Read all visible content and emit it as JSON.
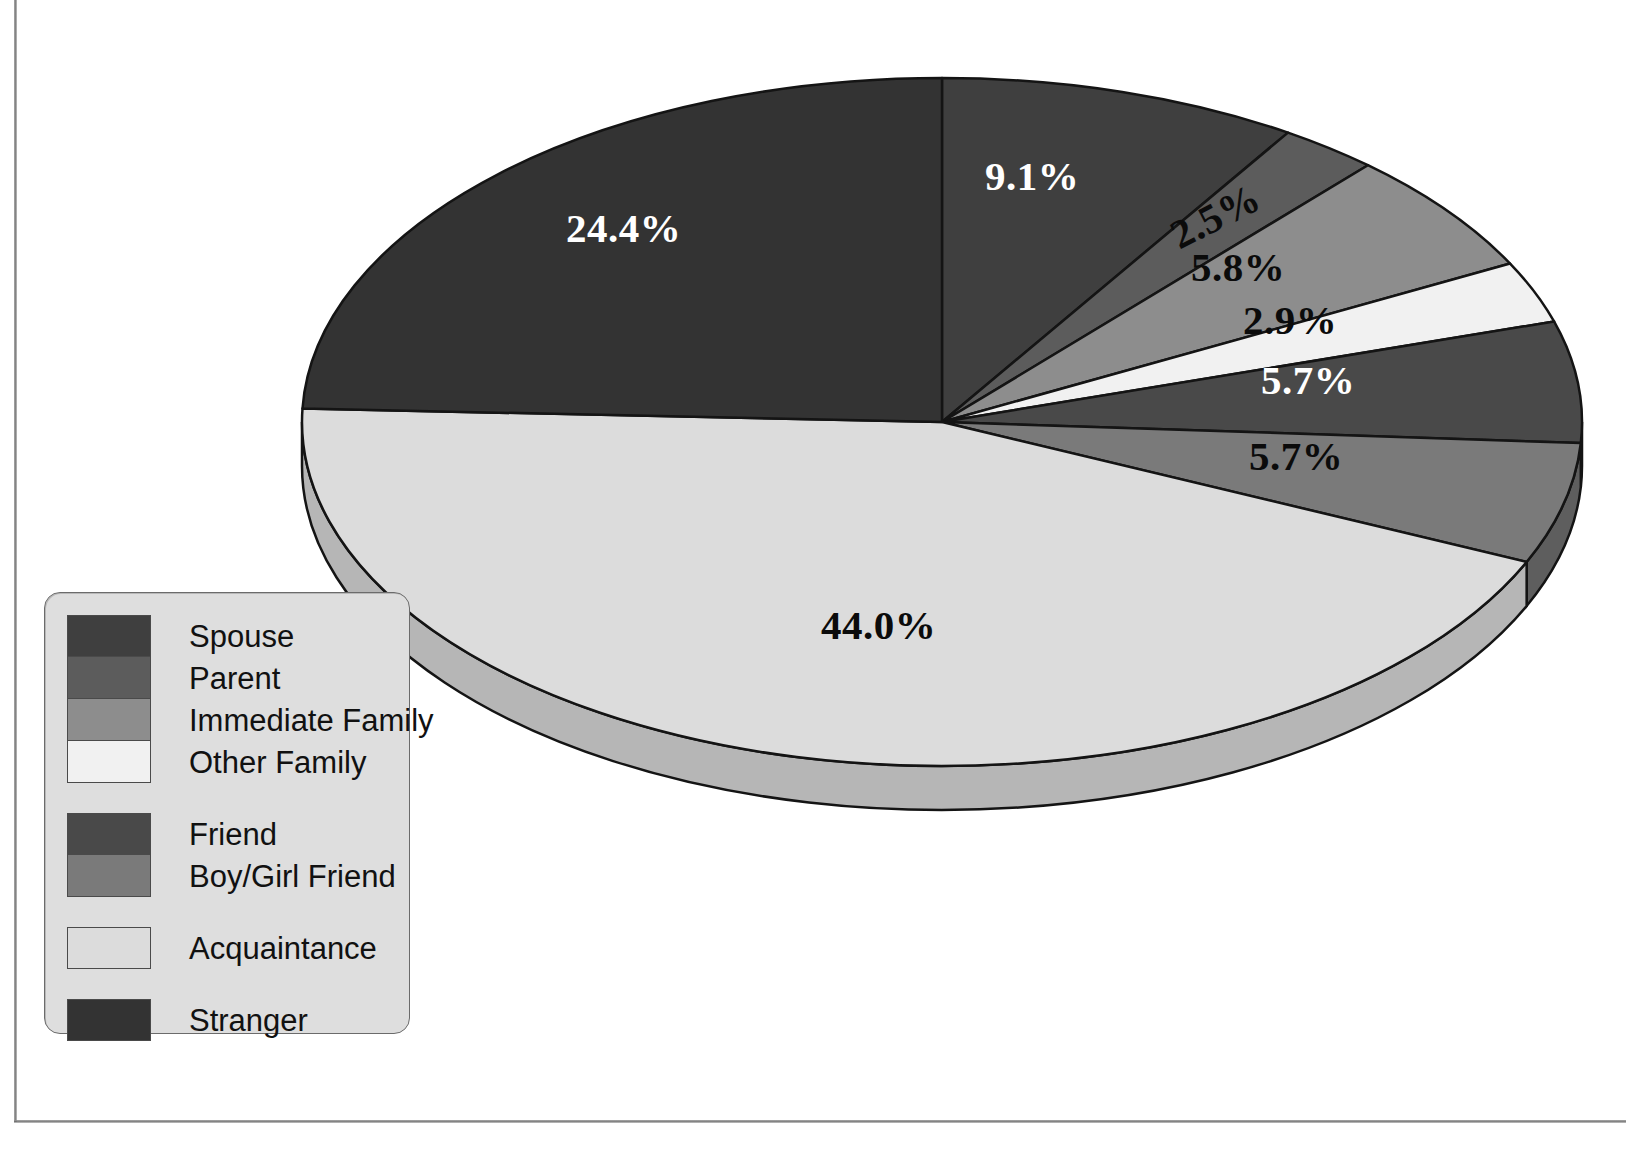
{
  "chart_data": {
    "type": "pie",
    "title": "",
    "subtitle": "",
    "xlabel": "",
    "ylabel": "",
    "grid": false,
    "legend_position": "bottom-left",
    "three_d": true,
    "start_angle_deg": 0,
    "direction": "clockwise",
    "categories": [
      "Spouse",
      "Parent",
      "Immediate Family",
      "Other Family",
      "Friend",
      "Boy/Girl Friend",
      "Acquaintance",
      "Stranger"
    ],
    "values": [
      9.1,
      2.5,
      5.8,
      2.9,
      5.7,
      5.7,
      44.0,
      24.4
    ],
    "labels": [
      "9.1%",
      "2.5%",
      "5.8%",
      "2.9%",
      "5.7%",
      "5.7%",
      "44.0%",
      "24.4%"
    ],
    "units": "percent",
    "colors": [
      "#3f3f3f",
      "#5c5c5c",
      "#8d8d8d",
      "#f1f1f1",
      "#494949",
      "#7a7a7a",
      "#dcdcdc",
      "#333333"
    ],
    "side_colors": [
      "#2e2e2e",
      "#474747",
      "#6d6d6d",
      "#c9c9c9",
      "#383838",
      "#5e5e5e",
      "#b6b6b6",
      "#252525"
    ],
    "label_text_colors": [
      "#ffffff",
      "#0b0b0b",
      "#0b0b0b",
      "#0b0b0b",
      "#ffffff",
      "#0b0b0b",
      "#0b0b0b",
      "#ffffff"
    ]
  },
  "legend": {
    "items": [
      {
        "label": "Spouse",
        "color": "#3f3f3f"
      },
      {
        "label": "Parent",
        "color": "#5c5c5c"
      },
      {
        "label": "Immediate Family",
        "color": "#8d8d8d"
      },
      {
        "label": "Other Family",
        "color": "#f1f1f1"
      },
      {
        "label": "Friend",
        "color": "#494949"
      },
      {
        "label": "Boy/Girl Friend",
        "color": "#7a7a7a"
      },
      {
        "label": "Acquaintance",
        "color": "#dcdcdc"
      },
      {
        "label": "Stranger",
        "color": "#333333"
      }
    ]
  },
  "slice_labels": [
    {
      "text": "9.1%",
      "x": 985,
      "y": 152,
      "tone": "light"
    },
    {
      "text": "2.5%",
      "x": 1168,
      "y": 192,
      "tone": "dark",
      "rotate": -27
    },
    {
      "text": "5.8%",
      "x": 1191,
      "y": 243,
      "tone": "dark"
    },
    {
      "text": "2.9%",
      "x": 1243,
      "y": 296,
      "tone": "dark"
    },
    {
      "text": "5.7%",
      "x": 1261,
      "y": 356,
      "tone": "light"
    },
    {
      "text": "5.7%",
      "x": 1249,
      "y": 432,
      "tone": "dark"
    },
    {
      "text": "44.0%",
      "x": 821,
      "y": 601,
      "tone": "dark"
    },
    {
      "text": "24.4%",
      "x": 566,
      "y": 204,
      "tone": "light"
    }
  ]
}
